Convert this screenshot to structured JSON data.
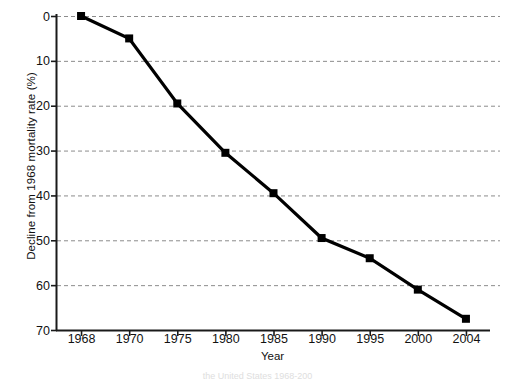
{
  "chart_data": {
    "type": "line",
    "title": "",
    "xlabel": "Year",
    "ylabel": "Decline from 1968 mortality rate (%)",
    "categories": [
      "1968",
      "1970",
      "1975",
      "1980",
      "1985",
      "1990",
      "1995",
      "2000",
      "2004"
    ],
    "values": [
      0,
      5,
      19.5,
      30.5,
      39.5,
      49.5,
      54,
      61,
      67.5
    ],
    "series": [
      {
        "name": "Decline from 1968 mortality rate",
        "values": [
          0,
          5,
          19.5,
          30.5,
          39.5,
          49.5,
          54,
          61,
          67.5
        ]
      }
    ],
    "ylim": [
      0,
      70
    ],
    "y_inverted": true,
    "yticks": [
      0,
      10,
      20,
      30,
      40,
      50,
      60,
      70
    ],
    "ytick_labels": [
      "0",
      "10",
      "20",
      "30",
      "40",
      "50",
      "60",
      "70"
    ],
    "xtick_labels": [
      "1968",
      "1970",
      "1975",
      "1980",
      "1985",
      "1990",
      "1995",
      "2000",
      "2004"
    ],
    "x_axis_type": "categorical",
    "grid": "horizontal-dashed",
    "legend": "none",
    "line_color": "#000000",
    "grid_color": "#8c8c8c",
    "marker": "square",
    "marker_color": "#000000"
  },
  "caption": {
    "partial_text": "the United States 1968-200"
  }
}
